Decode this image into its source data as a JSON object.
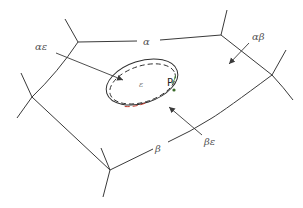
{
  "diagram": {
    "type": "foam-network-with-inclusion",
    "colors": {
      "line": "#3a3a3a",
      "label": "#555555",
      "ellipse_red_segment": "#c0392b",
      "ellipse_green_segment": "#4a8a3a"
    },
    "labels": {
      "alpha": "α",
      "beta": "β",
      "alpha_epsilon": "αε",
      "alpha_beta": "αβ",
      "beta_epsilon": "βε",
      "epsilon": "ε",
      "point": "P"
    }
  }
}
